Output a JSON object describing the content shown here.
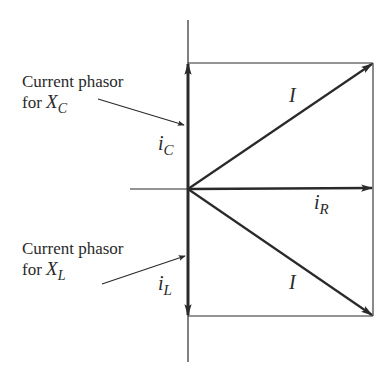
{
  "diagram": {
    "annotations": {
      "capacitor": {
        "line1": "Current phasor",
        "line2_prefix": "for ",
        "symbol": "X",
        "subscript": "C"
      },
      "inductor": {
        "line1": "Current phasor",
        "line2_prefix": "for ",
        "symbol": "X",
        "subscript": "L"
      }
    },
    "phasors": {
      "i_C": {
        "symbol": "i",
        "subscript": "C",
        "direction": "up"
      },
      "i_L": {
        "symbol": "i",
        "subscript": "L",
        "direction": "down"
      },
      "i_R": {
        "symbol": "i",
        "subscript": "R",
        "direction": "right"
      },
      "I_upper": {
        "symbol": "I",
        "direction": "up-right"
      },
      "I_lower": {
        "symbol": "I",
        "direction": "down-right"
      }
    },
    "colors": {
      "ink": "#2a2a2a",
      "background": "#ffffff"
    }
  }
}
